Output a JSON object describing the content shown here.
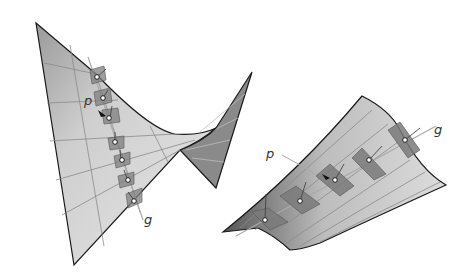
{
  "figure": {
    "left_surface": {
      "name": "saddle surface (hyperbolic paraboloid)",
      "labels": {
        "point": "p",
        "generator": "g"
      }
    },
    "right_surface": {
      "name": "ruled developable surface",
      "labels": {
        "point": "p",
        "generator": "g"
      }
    },
    "colors": {
      "surface_light": "#e2e2e2",
      "surface_mid": "#c8c8c8",
      "surface_dark": "#8c8c8c",
      "edge": "#1a1a1a",
      "grid": "#8a8a8a",
      "tangent_plane": "#7f7f7f",
      "generator_line": "#aaaaaa"
    }
  }
}
